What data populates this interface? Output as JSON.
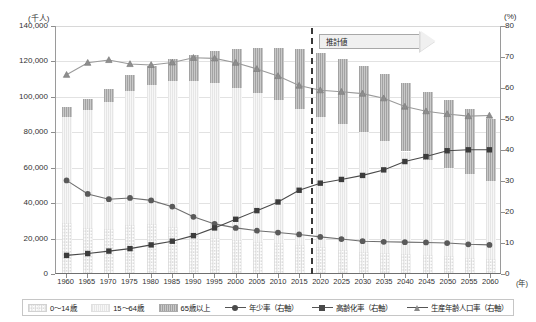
{
  "axes": {
    "left_unit": "(千人)",
    "right_unit": "(%)",
    "x_unit": "(年)",
    "left_ticks": [
      "140,000",
      "120,000",
      "100,000",
      "80,000",
      "60,000",
      "40,000",
      "20,000",
      "0"
    ],
    "right_ticks": [
      "80",
      "70",
      "60",
      "50",
      "40",
      "30",
      "20",
      "10",
      "0"
    ],
    "left_min": 0,
    "left_max": 140000,
    "right_min": 0,
    "right_max": 80
  },
  "annotation": {
    "estimate_label": "推計値",
    "divider_year": 2017.5
  },
  "legend": {
    "items": [
      {
        "key": "young_bar",
        "label": "0〜14歳",
        "type": "swatch",
        "swatch": "sw-young"
      },
      {
        "key": "work_bar",
        "label": "15〜64歳",
        "type": "swatch",
        "swatch": "sw-mid"
      },
      {
        "key": "old_bar",
        "label": "65歳以上",
        "type": "swatch",
        "swatch": "sw-old"
      },
      {
        "key": "youth_rate",
        "label": "年少率（右軸）",
        "type": "line",
        "marker": "circle"
      },
      {
        "key": "aging_rate",
        "label": "高齢化率（右軸）",
        "type": "line",
        "marker": "square"
      },
      {
        "key": "working_rate",
        "label": "生産年齢人口率（右軸）",
        "type": "line",
        "marker": "tri"
      }
    ]
  },
  "chart_data": {
    "type": "bar",
    "title": "",
    "xlabel": "(年)",
    "ylabel": "(千人)",
    "y2label": "(%)",
    "ylim": [
      0,
      140000
    ],
    "y2lim": [
      0,
      80
    ],
    "grid": true,
    "legend_position": "bottom",
    "categories": [
      "1960",
      "1965",
      "1970",
      "1975",
      "1980",
      "1985",
      "1990",
      "1995",
      "2000",
      "2005",
      "2010",
      "2015",
      "2020",
      "2025",
      "2030",
      "2035",
      "2040",
      "2045",
      "2050",
      "2055",
      "2060"
    ],
    "stacked_series": [
      {
        "name": "0〜14歳",
        "values": [
          28067,
          25166,
          24823,
          27221,
          27507,
          26033,
          22486,
          20014,
          18472,
          17521,
          16803,
          15827,
          14568,
          13240,
          12039,
          11287,
          10732,
          10116,
          9387,
          8614,
          7912
        ]
      },
      {
        "name": "15〜64歳",
        "values": [
          60002,
          66928,
          71566,
          75807,
          78835,
          82506,
          85904,
          87165,
          86220,
          84092,
          81032,
          76818,
          73408,
          70845,
          67730,
          63430,
          57866,
          53531,
          50013,
          47063,
          44183
        ]
      },
      {
        "name": "65歳以上",
        "values": [
          5398,
          6236,
          7393,
          8865,
          10647,
          12468,
          14895,
          18261,
          22005,
          25672,
          29246,
          33952,
          36124,
          36573,
          36849,
          37407,
          38678,
          38564,
          38406,
          37042,
          34642
        ]
      }
    ],
    "total_population": [
      93419,
      98330,
      103720,
      111940,
      116990,
      121049,
      123611,
      125570,
      126926,
      127768,
      128057,
      126597,
      124100,
      120659,
      116618,
      112124,
      107276,
      102210,
      97076,
      92732,
      86737
    ],
    "line_series": [
      {
        "name": "年少率（右軸）",
        "axis": "right",
        "marker": "circle",
        "values": [
          30.0,
          25.6,
          23.9,
          24.3,
          23.5,
          21.5,
          18.2,
          15.9,
          14.6,
          13.7,
          13.1,
          12.5,
          11.7,
          11.0,
          10.3,
          10.1,
          10.0,
          9.9,
          9.7,
          9.3,
          9.1
        ]
      },
      {
        "name": "高齢化率（右軸）",
        "axis": "right",
        "marker": "square",
        "values": [
          5.7,
          6.3,
          7.1,
          7.9,
          9.1,
          10.3,
          12.1,
          14.6,
          17.4,
          20.2,
          23.0,
          26.8,
          29.1,
          30.3,
          31.6,
          33.4,
          36.1,
          37.7,
          39.6,
          39.9,
          39.9
        ]
      },
      {
        "name": "生産年齢人口率（右軸）",
        "axis": "right",
        "marker": "triangle",
        "values": [
          64.2,
          68.1,
          69.0,
          67.7,
          67.4,
          68.2,
          69.7,
          69.5,
          68.1,
          66.1,
          63.8,
          60.7,
          59.2,
          58.7,
          58.1,
          56.6,
          53.9,
          52.4,
          51.5,
          50.8,
          51.0
        ]
      }
    ]
  }
}
